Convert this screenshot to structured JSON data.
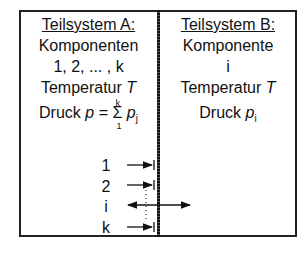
{
  "subsystemA": {
    "title": "Teilsystem A:",
    "line1": "Komponenten",
    "line2": "1, 2, ... , k",
    "temp_label": "Temperatur ",
    "temp_var": "T",
    "pressure_label": "Druck ",
    "pressure_var": "p",
    "pressure_eq": " = ",
    "sum_symbol": "Σ",
    "sum_upper": "k",
    "sum_lower": "1",
    "sum_var": "p",
    "sum_sub": "j"
  },
  "subsystemB": {
    "title": "Teilsystem B:",
    "line1": "Komponente",
    "line2": "i",
    "temp_label": "Temperatur ",
    "temp_var": "T",
    "pressure_label": "Druck ",
    "pressure_var": "p",
    "pressure_sub": "i"
  },
  "components": [
    {
      "label": "1",
      "arrow": "blocked"
    },
    {
      "label": "2",
      "arrow": "blocked"
    },
    {
      "label": "i",
      "arrow": "passes"
    },
    {
      "label": "k",
      "arrow": "blocked"
    }
  ]
}
